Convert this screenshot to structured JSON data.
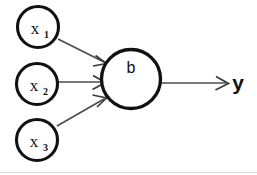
{
  "diagram": {
    "background_color": "#ffffff",
    "node_stroke_color": "#111111",
    "edge_color": "#4d4d4d",
    "input_nodes": [
      {
        "id": "x1",
        "base": "x",
        "subscript": "1",
        "cx": 38,
        "cy": 27,
        "r": 20.5
      },
      {
        "id": "x2",
        "base": "x",
        "subscript": "2",
        "cx": 37,
        "cy": 84,
        "r": 20.5
      },
      {
        "id": "x3",
        "base": "x",
        "subscript": "3",
        "cx": 37,
        "cy": 140,
        "r": 20.5
      }
    ],
    "main_node": {
      "id": "b",
      "label": "b",
      "cx": 131,
      "cy": 79,
      "r": 29.5,
      "label_x": 131,
      "label_y": 73
    },
    "output": {
      "label": "y",
      "x": 238,
      "y": 90
    },
    "edges": [
      {
        "id": "x1-to-b",
        "from": "x1",
        "to": "b",
        "x1": 58,
        "y1": 39,
        "x2": 106,
        "y2": 63
      },
      {
        "id": "x2-to-b",
        "from": "x2",
        "to": "b",
        "x1": 58,
        "y1": 82,
        "x2": 105,
        "y2": 82
      },
      {
        "id": "x3-to-b",
        "from": "x3",
        "to": "b",
        "x1": 57,
        "y1": 126,
        "x2": 106,
        "y2": 98
      },
      {
        "id": "b-to-y",
        "from": "b",
        "to": "y",
        "x1": 161,
        "y1": 83,
        "x2": 228,
        "y2": 83
      }
    ],
    "baseline_rule": {
      "y": 172,
      "x1": 0,
      "x2": 257,
      "color": "#d8d8d8"
    }
  }
}
